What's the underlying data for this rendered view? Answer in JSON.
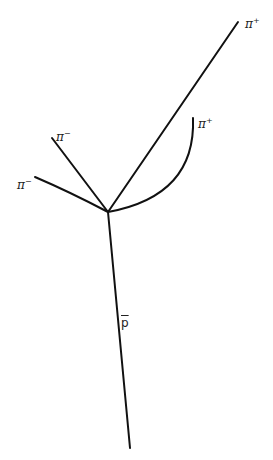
{
  "diagram": {
    "type": "particle-decay-event",
    "vertex": {
      "x": 108,
      "y": 212
    },
    "tracks": [
      {
        "id": "pi_plus_long",
        "particle": "π",
        "charge": "+",
        "shape": "straight",
        "end": {
          "x": 238,
          "y": 22
        }
      },
      {
        "id": "pi_plus_curved",
        "particle": "π",
        "charge": "+",
        "shape": "curved",
        "end": {
          "x": 193,
          "y": 118
        }
      },
      {
        "id": "pi_minus_upper",
        "particle": "π",
        "charge": "−",
        "shape": "straight",
        "end": {
          "x": 52,
          "y": 138
        }
      },
      {
        "id": "pi_minus_lower",
        "particle": "π",
        "charge": "−",
        "shape": "curved",
        "end": {
          "x": 35,
          "y": 177
        }
      },
      {
        "id": "antiproton",
        "particle": "p",
        "charge": "",
        "shape": "straight",
        "end": {
          "x": 130,
          "y": 448
        }
      }
    ],
    "labels": {
      "pi_plus_long": {
        "base": "π",
        "sup": "+"
      },
      "pi_plus_curved": {
        "base": "π",
        "sup": "+"
      },
      "pi_minus_upper": {
        "base": "π",
        "sup": "−"
      },
      "pi_minus_lower": {
        "base": "π",
        "sup": "−"
      },
      "antiproton": {
        "base": "p"
      }
    }
  }
}
